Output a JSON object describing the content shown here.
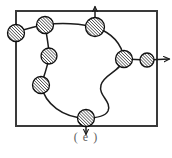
{
  "figure": {
    "caption": "( e )",
    "label_letter": "e",
    "colors": {
      "background": "#ffffff",
      "border": "#3a3a3a",
      "curve": "#1c1c1c",
      "node_fill": "#ffffff",
      "node_hatch": "#141414",
      "node_stroke": "#0f0f0f",
      "caption_text": "#5d5d5d"
    },
    "boundary_box": {
      "name": "boundary-rectangle",
      "x": 16,
      "y": 11,
      "width": 141,
      "height": 115,
      "stroke_width": 2
    },
    "nodes": [
      {
        "id": "node-left-edge",
        "cx": 16,
        "cy": 33,
        "r": 8.5
      },
      {
        "id": "node-top-left",
        "cx": 45,
        "cy": 25,
        "r": 8.5
      },
      {
        "id": "node-top-arrow",
        "cx": 95,
        "cy": 27,
        "r": 9.5
      },
      {
        "id": "node-inner-upper",
        "cx": 49,
        "cy": 56,
        "r": 8.0
      },
      {
        "id": "node-inner-lower",
        "cx": 41,
        "cy": 85,
        "r": 8.5
      },
      {
        "id": "node-right-mid",
        "cx": 124,
        "cy": 59,
        "r": 8.5
      },
      {
        "id": "node-right-outer",
        "cx": 147,
        "cy": 60,
        "r": 7.0
      },
      {
        "id": "node-bottom",
        "cx": 86,
        "cy": 118,
        "r": 8.5
      }
    ],
    "arrows": [
      {
        "id": "arrow-up-top",
        "direction": "up",
        "from_x": 95,
        "from_y": 27,
        "to_x": 95,
        "to_y": 6
      },
      {
        "id": "arrow-right-side",
        "direction": "right",
        "from_x": 147,
        "from_y": 60,
        "to_x": 170,
        "to_y": 59
      },
      {
        "id": "arrow-down-bottom",
        "direction": "down",
        "from_x": 86,
        "from_y": 118,
        "to_x": 86,
        "to_y": 136
      }
    ],
    "curve_segments": [
      {
        "id": "seg-left-to-topleft",
        "path": "M 8 35 C 20 31, 33 26, 45 25"
      },
      {
        "id": "seg-topleft-to-toparrow",
        "path": "M 45 25 C 62 22, 80 24, 95 27"
      },
      {
        "id": "seg-topleft-down",
        "path": "M 45 25 C 47 38, 49 46, 49 56"
      },
      {
        "id": "seg-inner-down",
        "path": "M 49 56 C 48 66, 44 76, 41 85"
      },
      {
        "id": "seg-inner-to-bottom",
        "path": "M 41 85 C 45 104, 63 118, 86 118"
      },
      {
        "id": "seg-toparrow-to-right",
        "path": "M 95 27 C 112 33, 122 44, 124 59"
      },
      {
        "id": "seg-right-to-outer",
        "path": "M 124 59 L 147 60"
      },
      {
        "id": "seg-right-s-curve",
        "path": "M 124 59 C 120 72, 104 74, 101 85 C 98 96, 112 101, 108 111 C 105 117, 95 118, 86 118"
      }
    ],
    "hatch": {
      "pattern_name": "diagonal-hatch",
      "angle_deg": -45,
      "spacing_px": 2.2,
      "line_width": 1.1
    }
  }
}
